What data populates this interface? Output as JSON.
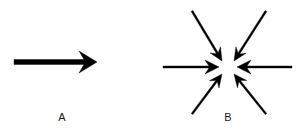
{
  "figure": {
    "width": 302,
    "height": 133,
    "background_color": "#ffffff",
    "stroke_color": "#000000",
    "type": "diagram"
  },
  "panels": [
    {
      "id": "A",
      "label": "A",
      "label_x": 62,
      "label_y": 118,
      "kind": "single-directional-arrow",
      "arrow_count": 1,
      "arrows": [
        {
          "name": "rightward-arrow",
          "direction": "right",
          "angle_deg": 0,
          "tail_x": 14,
          "tail_y": 62,
          "tip_x": 97,
          "tip_y": 62,
          "shaft_thickness": 5,
          "head_length": 18,
          "head_half_width": 11,
          "head_notch": 5,
          "color": "#000000"
        }
      ]
    },
    {
      "id": "B",
      "label": "B",
      "label_x": 228,
      "label_y": 118,
      "kind": "converging-arrows",
      "arrow_count": 6,
      "center_x": 228,
      "center_y": 67,
      "head_gap": 6,
      "arrows": [
        {
          "name": "arrow-from-upper-left",
          "direction": "down-right",
          "angle_deg": 45,
          "tail_x": 192,
          "tail_y": 11,
          "tip_x": 222,
          "tip_y": 61,
          "shaft_thickness": 2,
          "head_length": 13,
          "head_half_width": 6,
          "head_notch": 4,
          "color": "#000000"
        },
        {
          "name": "arrow-from-upper-right",
          "direction": "down-left",
          "angle_deg": 135,
          "tail_x": 266,
          "tail_y": 11,
          "tip_x": 234,
          "tip_y": 61,
          "shaft_thickness": 2,
          "head_length": 13,
          "head_half_width": 6,
          "head_notch": 4,
          "color": "#000000"
        },
        {
          "name": "arrow-from-left",
          "direction": "right",
          "angle_deg": 0,
          "tail_x": 163,
          "tail_y": 67,
          "tip_x": 219,
          "tip_y": 67,
          "shaft_thickness": 2,
          "head_length": 14,
          "head_half_width": 7,
          "head_notch": 4,
          "color": "#000000"
        },
        {
          "name": "arrow-from-right",
          "direction": "left",
          "angle_deg": 180,
          "tail_x": 292,
          "tail_y": 67,
          "tip_x": 237,
          "tip_y": 67,
          "shaft_thickness": 2,
          "head_length": 14,
          "head_half_width": 7,
          "head_notch": 4,
          "color": "#000000"
        },
        {
          "name": "arrow-from-lower-left",
          "direction": "up-right",
          "angle_deg": -45,
          "tail_x": 192,
          "tail_y": 114,
          "tip_x": 222,
          "tip_y": 74,
          "shaft_thickness": 2,
          "head_length": 13,
          "head_half_width": 6,
          "head_notch": 4,
          "color": "#000000"
        },
        {
          "name": "arrow-from-lower-right",
          "direction": "up-left",
          "angle_deg": -135,
          "tail_x": 266,
          "tail_y": 114,
          "tip_x": 234,
          "tip_y": 74,
          "shaft_thickness": 2,
          "head_length": 13,
          "head_half_width": 6,
          "head_notch": 4,
          "color": "#000000"
        }
      ]
    }
  ]
}
